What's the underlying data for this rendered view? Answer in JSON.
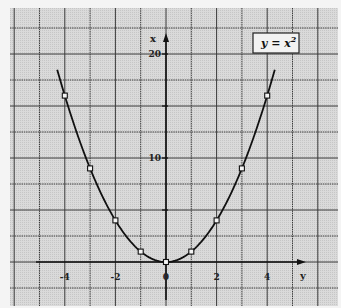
{
  "chart_data": {
    "type": "line",
    "title": "",
    "legend": [
      "y = x²"
    ],
    "legend_text": "y = x",
    "legend_sup": "2",
    "legend_position": "top-right",
    "xlabel": "y",
    "ylabel": "x",
    "xlim": [
      -6,
      7
    ],
    "ylim": [
      -4,
      24
    ],
    "grid": true,
    "x_ticks": [
      -4,
      -2,
      0,
      2,
      4
    ],
    "x_tick_labels": [
      "-4",
      "-2",
      "0",
      "2",
      "4"
    ],
    "y_ticks": [
      10,
      20
    ],
    "y_tick_labels": [
      "10",
      "20"
    ],
    "series": [
      {
        "name": "y = x^2",
        "style": "curve with square markers",
        "x": [
          -4,
          -3,
          -2,
          -1,
          0,
          1,
          2,
          3,
          4
        ],
        "values": [
          16,
          9,
          4,
          1,
          0,
          1,
          4,
          9,
          16
        ]
      }
    ],
    "curve_range": [
      -4.3,
      4.3
    ]
  },
  "colors": {
    "background": "#f4f4f4",
    "panel": "#d9d9d9",
    "grid": "#3a3a3a",
    "curve": "#111111"
  }
}
